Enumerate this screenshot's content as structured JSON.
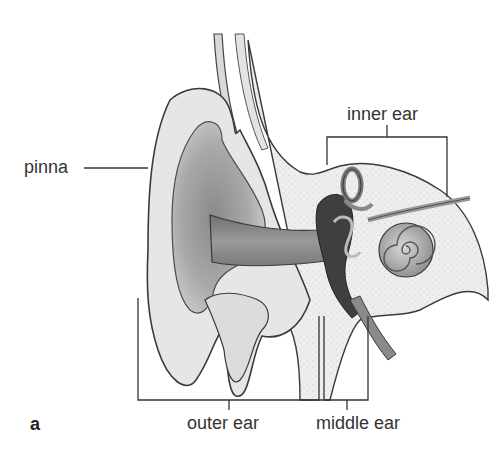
{
  "figure": {
    "panel_letter": "a",
    "labels": {
      "pinna": "pinna",
      "inner_ear": "inner ear",
      "outer_ear": "outer ear",
      "middle_ear": "middle ear"
    },
    "colors": {
      "background": "#ffffff",
      "line": "#3a3a3a",
      "tissue_light": "#ececec",
      "tissue_mid": "#bdbdbd",
      "tissue_dark": "#555555",
      "text": "#333333"
    }
  }
}
